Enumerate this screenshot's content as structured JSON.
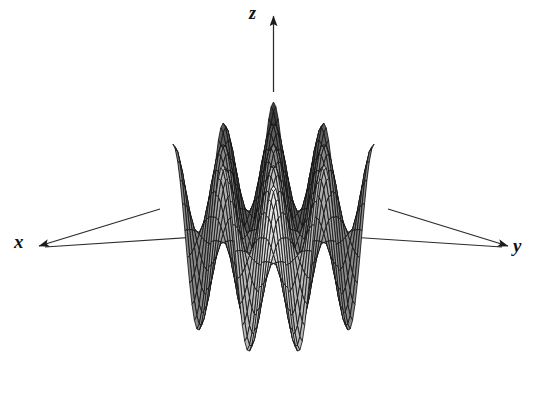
{
  "figure": {
    "kind": "3d-surface-mesh-plot",
    "background_color": "#ffffff",
    "width": 547,
    "height": 415
  },
  "axes": {
    "x": {
      "label": "x",
      "arrow": "arrowhead-icon",
      "direction": "down-left"
    },
    "y": {
      "label": "y",
      "arrow": "arrowhead-icon",
      "direction": "down-right"
    },
    "z": {
      "label": "z",
      "arrow": "arrowhead-icon",
      "direction": "up"
    },
    "line_color": "#2b2b2b"
  },
  "chart_data": {
    "type": "surface",
    "title": "",
    "xlabel": "x",
    "ylabel": "y",
    "zlabel": "z",
    "function": "z = cos(x) * cos(y)",
    "grid": true,
    "legend": false,
    "xlim": [
      -6.2832,
      6.2832
    ],
    "ylim": [
      -6.2832,
      6.2832
    ],
    "zlim": [
      -1,
      1
    ],
    "samples_u": 42,
    "samples_v": 42,
    "projection": {
      "type": "oblique-isometric",
      "azimuth_deg": 45,
      "elevation_deg": 24
    },
    "peaks": [
      {
        "name": "center-back-peak",
        "x": 0,
        "y": 0,
        "z": 1,
        "shade": "#3a3a3a"
      },
      {
        "name": "left-peak",
        "x": -3.1416,
        "y": 3.1416,
        "z": 1,
        "shade": "#6d6d6d"
      },
      {
        "name": "right-peak",
        "x": 3.1416,
        "y": -3.1416,
        "z": 1,
        "shade": "#6d6d6d"
      },
      {
        "name": "front-peak",
        "x": 3.1416,
        "y": 3.1416,
        "z": 1,
        "shade": "#d0d0d0"
      },
      {
        "name": "back-left-lobe",
        "x": -3.1416,
        "y": -3.1416,
        "z": 1,
        "shade": "#4a4a4a"
      }
    ],
    "valleys": [
      {
        "name": "valley-left",
        "x": -3.1416,
        "y": 0,
        "z": -1
      },
      {
        "name": "valley-right",
        "x": 3.1416,
        "y": 0,
        "z": -1
      },
      {
        "name": "valley-front",
        "x": 0,
        "y": 3.1416,
        "z": -1
      },
      {
        "name": "valley-back",
        "x": 0,
        "y": -3.1416,
        "z": -1
      }
    ],
    "shading": {
      "light_direction": "front-lower-right",
      "darkest": "#2e2e2e",
      "lightest": "#e3e3e3",
      "mesh_line_color": "#141414",
      "mesh_line_width": 0.85
    }
  }
}
